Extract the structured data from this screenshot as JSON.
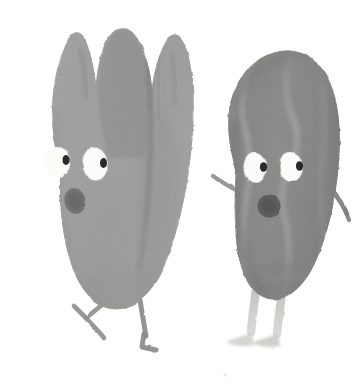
{
  "artwork": {
    "title": "Two seed characters illustration",
    "medium": "watercolor / gouache painterly illustration",
    "background_color": "#ffffff",
    "canvas": {
      "width": 363,
      "height": 385
    },
    "style_notes": "Hand-painted textured grayscale characters with cartoon faces on a plain white background",
    "palette": {
      "paper_white": "#ffffff",
      "body_light_gray": "#a7a7a5",
      "body_mid_gray": "#999997",
      "body_dark_gray": "#7e7e7c",
      "body_darker_gray": "#6f6f6d",
      "crease_shadow": "#6b6b69",
      "ridge_highlight": "#b5b5b2",
      "eye_white": "#fbfbf8",
      "pupil_black": "#2a2a28",
      "mouth_dark": "#6a6a68",
      "limb_gray": "#8d8d8b",
      "limb_pale": "#cdcdc9",
      "outline_soft": "#8a8a88"
    },
    "characters": [
      {
        "id": "left-character",
        "name": "Three-lobed tulip-shaped seed character",
        "position": "left",
        "shape": "tulip / pecan half with three pointed top lobes",
        "tone": "light-to-mid gray",
        "features": {
          "lobes": 3,
          "middle_lobe_tone": "darker gray",
          "center_crease": "dark vertical crease down right-of-center",
          "eyes": 2,
          "eye_shape": "white ovals, slight tilt",
          "pupil_side": "right side of each eye",
          "mouth": "small dark oval, open O",
          "arms": 0,
          "legs": 2,
          "leg_style": "thin stick legs, left leg bent back in a V, right leg striding with flat foot"
        }
      },
      {
        "id": "right-character",
        "name": "Wavy-ridged oval nut character",
        "position": "right",
        "shape": "almond / pecan oval with wavy lighter ridges",
        "tone": "mid-to-dark gray",
        "features": {
          "ridges": "two lighter S-curve wavy ridges running top to bottom",
          "eyes": 2,
          "eye_shape": "white ovals",
          "pupil_side": "right side of each eye",
          "mouth": "round dark circle, open O",
          "arms": 2,
          "arm_style": "short twig arms, left arm points up-left, right arm angles down-right",
          "legs": 2,
          "leg_style": "pale straight legs with feet pointing left"
        }
      }
    ],
    "marks": [
      {
        "name": "faint-speck",
        "x": 225,
        "y": 375,
        "note": "tiny pale smudge on paper near bottom center-right"
      }
    ]
  }
}
